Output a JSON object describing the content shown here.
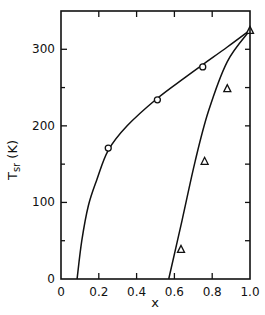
{
  "chart_data": {
    "type": "scatter",
    "title": "",
    "xlabel": "x",
    "ylabel": "T",
    "ylabel_sub": "sr",
    "ylabel_unit": "(K)",
    "xlim": [
      0,
      1.0
    ],
    "ylim": [
      0,
      350
    ],
    "x_ticks": [
      "0",
      "0.2",
      "0.4",
      "0.6",
      "0.8",
      "1.0"
    ],
    "x_tick_values": [
      0,
      0.2,
      0.4,
      0.6,
      0.8,
      1.0
    ],
    "y_ticks": [
      "0",
      "100",
      "200",
      "300"
    ],
    "y_tick_values": [
      0,
      100,
      200,
      300
    ],
    "grid": false,
    "legend": null,
    "series": [
      {
        "name": "circles",
        "marker": "circle",
        "points": [
          {
            "x": 0.25,
            "y": 171
          },
          {
            "x": 0.51,
            "y": 234
          },
          {
            "x": 0.75,
            "y": 277
          }
        ]
      },
      {
        "name": "triangles",
        "marker": "triangle",
        "points": [
          {
            "x": 0.635,
            "y": 39
          },
          {
            "x": 0.76,
            "y": 154
          },
          {
            "x": 0.88,
            "y": 249
          },
          {
            "x": 1.0,
            "y": 325
          }
        ]
      }
    ],
    "curves": [
      {
        "name": "left-fit-curve",
        "points": [
          {
            "x": 0.085,
            "y": 0
          },
          {
            "x": 0.11,
            "y": 50
          },
          {
            "x": 0.145,
            "y": 96
          },
          {
            "x": 0.19,
            "y": 130
          },
          {
            "x": 0.25,
            "y": 168
          },
          {
            "x": 0.35,
            "y": 200
          },
          {
            "x": 0.51,
            "y": 236
          },
          {
            "x": 0.65,
            "y": 262
          },
          {
            "x": 0.75,
            "y": 280
          },
          {
            "x": 0.88,
            "y": 303
          },
          {
            "x": 1.0,
            "y": 325
          }
        ]
      },
      {
        "name": "right-fit-curve",
        "points": [
          {
            "x": 0.57,
            "y": 0
          },
          {
            "x": 0.64,
            "y": 76
          },
          {
            "x": 0.71,
            "y": 154
          },
          {
            "x": 0.78,
            "y": 219
          },
          {
            "x": 0.88,
            "y": 284
          },
          {
            "x": 1.0,
            "y": 325
          }
        ]
      }
    ]
  }
}
